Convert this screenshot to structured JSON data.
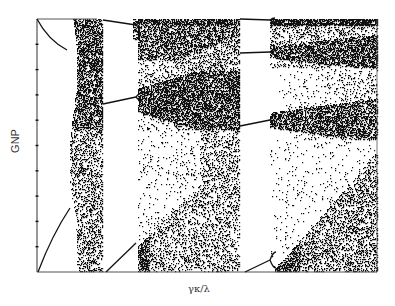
{
  "chart_data": {
    "type": "scatter",
    "subtype": "bifurcation-diagram",
    "title": "",
    "xlabel": "γκ/λ",
    "ylabel": "GNP",
    "x_ticks": [],
    "y_ticks_count": 10,
    "grid": false,
    "legend": null,
    "panels": [
      {
        "name": "panel-1",
        "x_range": [
          37,
          103
        ],
        "branch_start": [
          37,
          272
        ],
        "branch_end": [
          70,
          208
        ],
        "chaos_band": [
          73,
          103
        ],
        "upper_branch": {
          "start": [
            37,
            19
          ],
          "end": [
            67,
            50
          ]
        }
      },
      {
        "name": "panel-2",
        "x_range": [
          103,
          240
        ],
        "branch_start": [
          103,
          272
        ],
        "branch_end": [
          136,
          243
        ],
        "chaos_band": [
          140,
          240
        ],
        "upper_branches": [
          {
            "start": [
              103,
              20
            ],
            "end": [
              136,
              25
            ]
          },
          {
            "start": [
              103,
              103
            ],
            "end": [
              136,
              97
            ]
          }
        ]
      },
      {
        "name": "panel-3",
        "x_range": [
          240,
          377
        ],
        "branch_start": [
          240,
          272
        ],
        "branch_end": [
          272,
          258
        ],
        "chaos_band": [
          275,
          377
        ],
        "upper_branches": [
          {
            "start": [
              240,
              19
            ],
            "end": [
              270,
              20
            ]
          },
          {
            "start": [
              240,
              53
            ],
            "end": [
              270,
              52
            ]
          },
          {
            "start": [
              240,
              126
            ],
            "end": [
              270,
              120
            ]
          }
        ]
      }
    ],
    "frame": {
      "left": 37,
      "top": 19,
      "right": 377,
      "bottom": 272
    }
  },
  "labels": {
    "x": "γκ/λ",
    "y": "GNP"
  },
  "colors": {
    "ink": "#111111",
    "background": "#ffffff",
    "axis": "#555555"
  }
}
